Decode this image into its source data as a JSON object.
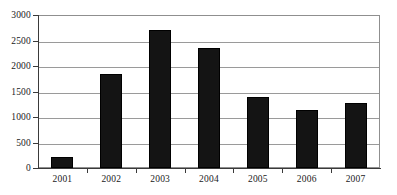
{
  "chart_data": {
    "type": "bar",
    "title": "",
    "subtitle": "",
    "xlabel": "",
    "ylabel": "",
    "categories": [
      "2001",
      "2002",
      "2003",
      "2004",
      "2005",
      "2006",
      "2007"
    ],
    "values": [
      220,
      1850,
      2700,
      2350,
      1400,
      1130,
      1270
    ],
    "series": [
      {
        "name": "",
        "values": [
          220,
          1850,
          2700,
          2350,
          1400,
          1130,
          1270
        ]
      }
    ],
    "ylim": [
      0,
      3000
    ],
    "ytick_labels": [
      "0",
      "500",
      "1000",
      "1500",
      "2000",
      "2500",
      "3000"
    ],
    "ytick_values": [
      0,
      500,
      1000,
      1500,
      2000,
      2500,
      3000
    ],
    "xtick_labels": [
      "2001",
      "2002",
      "2003",
      "2004",
      "2005",
      "2006",
      "2007"
    ],
    "grid": true,
    "grid_axis": "y",
    "legend": false,
    "legend_position": "none",
    "bar_color": "#141414",
    "grid_color": "#9a9a9a",
    "axis_color": "#3a3a3a",
    "background_color": "#ffffff",
    "annotations": []
  }
}
